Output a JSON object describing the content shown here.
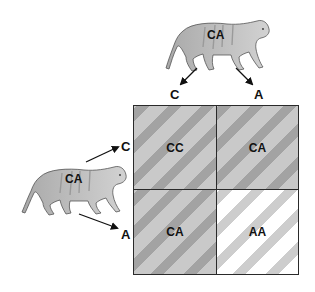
{
  "diagram": {
    "type": "punnett-square",
    "top_parent": {
      "genotype": "CA",
      "icon": "tiger-icon"
    },
    "left_parent": {
      "genotype": "CA",
      "icon": "tiger-icon"
    },
    "top_alleles": [
      "C",
      "A"
    ],
    "left_alleles": [
      "C",
      "A"
    ],
    "cells": [
      {
        "row": 0,
        "col": 0,
        "genotype": "CC",
        "shade": "dark-striped"
      },
      {
        "row": 0,
        "col": 1,
        "genotype": "CA",
        "shade": "dark-striped"
      },
      {
        "row": 1,
        "col": 0,
        "genotype": "CA",
        "shade": "dark-striped"
      },
      {
        "row": 1,
        "col": 1,
        "genotype": "AA",
        "shade": "light-striped"
      }
    ],
    "colors": {
      "stripe_dark_bg": "#c9c9c9",
      "stripe_dark_band": "#a3a3a3",
      "stripe_light_bg": "#ffffff",
      "stripe_light_band": "#cdcdcd",
      "tiger_fill": "#bdbdbd",
      "line": "#111111"
    }
  }
}
